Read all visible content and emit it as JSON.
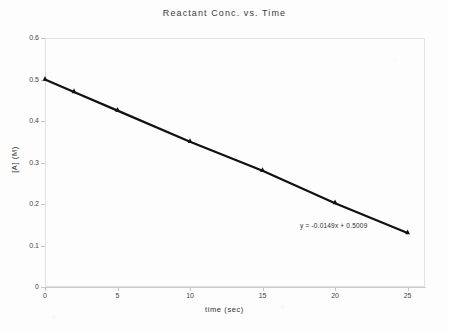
{
  "chart_data": {
    "type": "scatter",
    "title": "Reactant  Conc.  vs.  Time",
    "xlabel": "time  (sec)",
    "ylabel": "[A]  (M)",
    "x": [
      0,
      2,
      5,
      10,
      15,
      20,
      25
    ],
    "values": [
      0.5,
      0.47,
      0.425,
      0.35,
      0.28,
      0.202,
      0.13
    ],
    "series": [
      {
        "name": "[A]",
        "x": [
          0,
          2,
          5,
          10,
          15,
          20,
          25
        ],
        "values": [
          0.5,
          0.47,
          0.425,
          0.35,
          0.28,
          0.202,
          0.13
        ]
      }
    ],
    "xlim": [
      0,
      26.2
    ],
    "ylim": [
      0,
      0.6
    ],
    "xticks": [
      0,
      5,
      10,
      15,
      20,
      25
    ],
    "xtick_labels": [
      "0",
      "5",
      "10",
      "15",
      "20",
      "25"
    ],
    "yticks": [
      0,
      0.1,
      0.2,
      0.3,
      0.4,
      0.5,
      0.6
    ],
    "ytick_labels": [
      "0",
      "0.1",
      "0.2",
      "0.3",
      "0.4",
      "0.5",
      "0.6"
    ],
    "grid": false,
    "legend": "none",
    "annotations": [
      {
        "name": "trendline-equation",
        "text": "y = -0.0149x + 0.5009",
        "slope": -0.0149,
        "intercept": 0.5009
      }
    ],
    "marker_color": "#111111",
    "line_color": "#111111",
    "axis_color": "#cccccc",
    "background": "#fdfdfd"
  }
}
